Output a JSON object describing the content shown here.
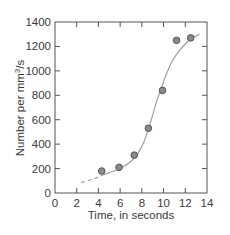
{
  "chart_data": {
    "type": "scatter",
    "title": "",
    "xlabel": "Time, in seconds",
    "ylabel": "Number per mm³/s",
    "ylabel_parts": {
      "base": "Number per mm",
      "sup": "3",
      "tail": "/s"
    },
    "xlim": [
      0,
      14
    ],
    "ylim": [
      0,
      1400
    ],
    "xticks": [
      0,
      2,
      4,
      6,
      8,
      10,
      12,
      14
    ],
    "yticks": [
      0,
      200,
      400,
      600,
      800,
      1000,
      1200,
      1400
    ],
    "grid": false,
    "legend": null,
    "series": [
      {
        "name": "observations",
        "kind": "scatter",
        "marker": "circle",
        "color": "#8a8a8a",
        "x": [
          4.3,
          5.9,
          7.3,
          8.6,
          9.9,
          11.2,
          12.5
        ],
        "y": [
          180,
          210,
          310,
          530,
          840,
          1250,
          1270
        ]
      },
      {
        "name": "fitted curve (extrapolated)",
        "kind": "line",
        "style": "dashed",
        "color": "#9a9a9a",
        "x": [
          2.4,
          3.0,
          3.6,
          4.2
        ],
        "y": [
          85,
          100,
          118,
          140
        ]
      },
      {
        "name": "fitted curve",
        "kind": "line",
        "style": "solid",
        "color": "#9a9a9a",
        "x": [
          4.2,
          5.0,
          6.0,
          7.0,
          7.6,
          8.2,
          8.6,
          9.0,
          9.4,
          9.8,
          10.2,
          10.8,
          11.4,
          12.0,
          12.6,
          13.3
        ],
        "y": [
          140,
          165,
          200,
          260,
          320,
          420,
          520,
          640,
          760,
          860,
          960,
          1080,
          1160,
          1220,
          1265,
          1300
        ]
      }
    ]
  }
}
